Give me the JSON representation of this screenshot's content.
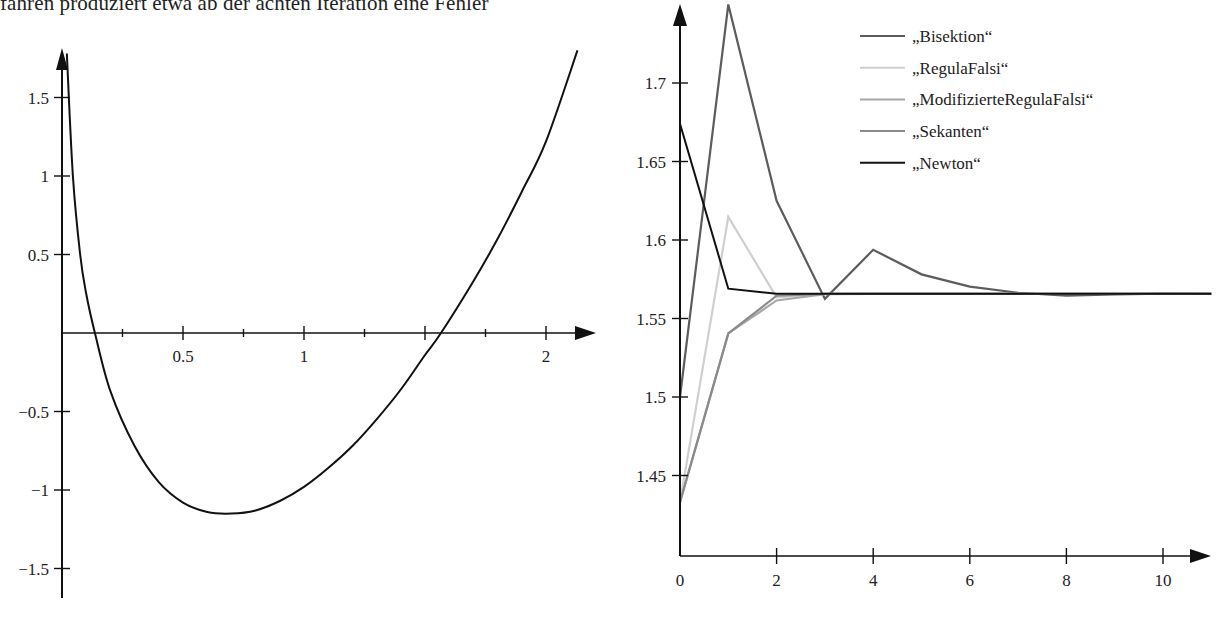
{
  "caption": "fahren produziert etwa ab der achten Iteration eine Fehler",
  "chart_data": [
    {
      "type": "line",
      "title": "",
      "xlabel": "",
      "ylabel": "",
      "xlim": [
        0,
        2.18
      ],
      "ylim": [
        -1.75,
        1.8
      ],
      "grid": false,
      "x_ticks": [
        0.25,
        0.5,
        0.75,
        1,
        1.25,
        1.5,
        1.75,
        2
      ],
      "x_tick_labels": [
        {
          "value": 0.5,
          "label": "0.5"
        },
        {
          "value": 1,
          "label": "1"
        },
        {
          "value": 2,
          "label": "2"
        }
      ],
      "y_ticks": [
        {
          "value": 1.5,
          "label": "1.5"
        },
        {
          "value": 1,
          "label": "1"
        },
        {
          "value": 0.5,
          "label": "0.5"
        },
        {
          "value": -0.5,
          "label": "−0.5"
        },
        {
          "value": -1,
          "label": "−1"
        },
        {
          "value": -1.5,
          "label": "−1.5"
        }
      ],
      "series": [
        {
          "name": "f(x)",
          "color": "#111111",
          "x": [
            0.02,
            0.045,
            0.075,
            0.1,
            0.136,
            0.2,
            0.3,
            0.4,
            0.5,
            0.6,
            0.7,
            0.8,
            0.9,
            1.0,
            1.1,
            1.2,
            1.3,
            1.4,
            1.5,
            1.566,
            1.7,
            1.8,
            1.9,
            2.0,
            2.13
          ],
          "y": [
            1.78,
            1.0,
            0.5,
            0.25,
            0.0,
            -0.37,
            -0.72,
            -0.95,
            -1.08,
            -1.14,
            -1.15,
            -1.13,
            -1.07,
            -0.98,
            -0.86,
            -0.72,
            -0.55,
            -0.36,
            -0.14,
            0.0,
            0.33,
            0.6,
            0.9,
            1.22,
            1.8
          ]
        }
      ]
    },
    {
      "type": "line",
      "title": "",
      "xlabel": "",
      "ylabel": "",
      "xlim": [
        0,
        11
      ],
      "ylim": [
        1.4,
        1.75
      ],
      "grid": false,
      "x_ticks": [
        {
          "value": 0,
          "label": "0"
        },
        {
          "value": 2,
          "label": "2"
        },
        {
          "value": 4,
          "label": "4"
        },
        {
          "value": 6,
          "label": "6"
        },
        {
          "value": 8,
          "label": "8"
        },
        {
          "value": 10,
          "label": "10"
        }
      ],
      "y_ticks": [
        {
          "value": 1.7,
          "label": "1.7"
        },
        {
          "value": 1.65,
          "label": "1.65"
        },
        {
          "value": 1.6,
          "label": "1.6"
        },
        {
          "value": 1.55,
          "label": "1.55"
        },
        {
          "value": 1.5,
          "label": "1.5"
        },
        {
          "value": 1.45,
          "label": "1.45"
        }
      ],
      "legend_position": "upper right",
      "series": [
        {
          "name": "„Bisektion“",
          "color": "#5c5c5c",
          "x": [
            0,
            1,
            2,
            3,
            4,
            5,
            6,
            7,
            8,
            9,
            10,
            11
          ],
          "y": [
            1.5,
            1.75,
            1.625,
            1.5625,
            1.59375,
            1.578125,
            1.5703,
            1.5664,
            1.5645,
            1.5654,
            1.5659,
            1.5657
          ]
        },
        {
          "name": "„RegulaFalsi“",
          "color": "#cfcfcf",
          "x": [
            0,
            1,
            2,
            3,
            4,
            5,
            6,
            7,
            8,
            9,
            10,
            11
          ],
          "y": [
            1.433,
            1.6147,
            1.5635,
            1.5657,
            1.5657,
            1.5657,
            1.5657,
            1.5657,
            1.5657,
            1.5657,
            1.5657,
            1.5657
          ]
        },
        {
          "name": "„ModifizierteRegulaFalsi“",
          "color": "#a8a8a8",
          "x": [
            0,
            1,
            2,
            3,
            4,
            5,
            6,
            7,
            8,
            9,
            10,
            11
          ],
          "y": [
            1.433,
            1.5405,
            1.5615,
            1.5655,
            1.5657,
            1.5657,
            1.5657,
            1.5657,
            1.5657,
            1.5657,
            1.5657,
            1.5657
          ]
        },
        {
          "name": "„Sekanten“",
          "color": "#8a8a8a",
          "x": [
            0,
            1,
            2,
            3,
            4,
            5,
            6,
            7,
            8,
            9,
            10,
            11
          ],
          "y": [
            1.433,
            1.5405,
            1.5645,
            1.5657,
            1.5657,
            1.5657,
            1.5657,
            1.5657,
            1.5657,
            1.5657,
            1.5657,
            1.5657
          ]
        },
        {
          "name": "„Newton“",
          "color": "#111111",
          "x": [
            0,
            1,
            2,
            3,
            4,
            5,
            6,
            7,
            8,
            9,
            10,
            11
          ],
          "y": [
            1.674,
            1.569,
            1.5657,
            1.5657,
            1.5657,
            1.5657,
            1.5657,
            1.5657,
            1.5657,
            1.5657,
            1.5657,
            1.5657
          ]
        }
      ]
    }
  ]
}
